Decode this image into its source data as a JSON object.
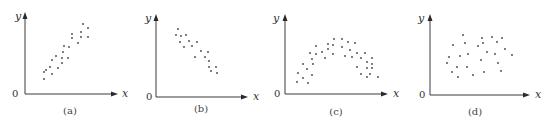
{
  "chart_data": [
    {
      "type": "scatter",
      "panel": "a",
      "caption": "(a)",
      "xlabel": "x",
      "ylabel": "y",
      "origin_label": "0",
      "description": "positive linear correlation",
      "axes": {
        "ox": 25,
        "oy": 94,
        "xend": 118,
        "ytop": 12,
        "ylabel_pos": [
          15,
          20
        ],
        "xlabel_pos": [
          122,
          97
        ],
        "zero_pos": [
          12,
          97
        ],
        "cap_pos": [
          70,
          114
        ]
      },
      "points": [
        [
          83,
          24
        ],
        [
          88,
          28
        ],
        [
          81,
          32
        ],
        [
          72,
          34
        ],
        [
          88,
          37
        ],
        [
          81,
          37
        ],
        [
          72,
          38
        ],
        [
          78,
          43
        ],
        [
          64,
          46
        ],
        [
          69,
          47
        ],
        [
          63,
          52
        ],
        [
          56,
          56
        ],
        [
          62,
          58
        ],
        [
          68,
          58
        ],
        [
          52,
          60
        ],
        [
          62,
          63
        ],
        [
          50,
          67
        ],
        [
          58,
          68
        ],
        [
          46,
          70
        ],
        [
          44,
          72
        ],
        [
          52,
          74
        ],
        [
          44,
          79
        ]
      ]
    },
    {
      "type": "scatter",
      "panel": "b",
      "caption": "(b)",
      "xlabel": "x",
      "ylabel": "y",
      "origin_label": "0",
      "description": "negative linear correlation",
      "axes": {
        "ox": 156,
        "oy": 97,
        "xend": 248,
        "ytop": 14,
        "ylabel_pos": [
          145,
          22
        ],
        "xlabel_pos": [
          253,
          100
        ],
        "zero_pos": [
          146,
          100
        ],
        "cap_pos": [
          201,
          112
        ]
      },
      "points": [
        [
          178,
          29
        ],
        [
          176,
          35
        ],
        [
          181,
          36
        ],
        [
          186,
          35
        ],
        [
          180,
          42
        ],
        [
          184,
          47
        ],
        [
          189,
          41
        ],
        [
          192,
          46
        ],
        [
          197,
          42
        ],
        [
          201,
          51
        ],
        [
          208,
          52
        ],
        [
          195,
          57
        ],
        [
          205,
          57
        ],
        [
          209,
          61
        ],
        [
          209,
          67
        ],
        [
          216,
          67
        ],
        [
          211,
          71
        ],
        [
          217,
          73
        ]
      ]
    },
    {
      "type": "scatter",
      "panel": "c",
      "caption": "(c)",
      "xlabel": "x",
      "ylabel": "y",
      "origin_label": "0",
      "description": "nonlinear (parabolic) relationship",
      "axes": {
        "ox": 285,
        "oy": 94,
        "xend": 388,
        "ytop": 14,
        "ylabel_pos": [
          273,
          22
        ],
        "xlabel_pos": [
          393,
          97
        ],
        "zero_pos": [
          274,
          97
        ],
        "cap_pos": [
          336,
          115
        ]
      },
      "points": [
        [
          334,
          39
        ],
        [
          342,
          39
        ],
        [
          348,
          42
        ],
        [
          355,
          43
        ],
        [
          328,
          44
        ],
        [
          333,
          45
        ],
        [
          316,
          46
        ],
        [
          342,
          47
        ],
        [
          328,
          49
        ],
        [
          322,
          52
        ],
        [
          350,
          50
        ],
        [
          310,
          53
        ],
        [
          316,
          54
        ],
        [
          333,
          54
        ],
        [
          345,
          56
        ],
        [
          357,
          53
        ],
        [
          365,
          53
        ],
        [
          325,
          58
        ],
        [
          312,
          59
        ],
        [
          352,
          57
        ],
        [
          361,
          58
        ],
        [
          372,
          58
        ],
        [
          303,
          64
        ],
        [
          313,
          64
        ],
        [
          367,
          62
        ],
        [
          372,
          64
        ],
        [
          307,
          69
        ],
        [
          357,
          67
        ],
        [
          367,
          68
        ],
        [
          372,
          68
        ],
        [
          298,
          73
        ],
        [
          312,
          75
        ],
        [
          361,
          74
        ],
        [
          370,
          74
        ],
        [
          303,
          78
        ],
        [
          367,
          77
        ],
        [
          297,
          82
        ],
        [
          378,
          77
        ],
        [
          308,
          83
        ]
      ]
    },
    {
      "type": "scatter",
      "panel": "d",
      "caption": "(d)",
      "xlabel": "x",
      "ylabel": "y",
      "origin_label": "0",
      "description": "no correlation",
      "axes": {
        "ox": 430,
        "oy": 95,
        "xend": 530,
        "ytop": 14,
        "ylabel_pos": [
          418,
          22
        ],
        "xlabel_pos": [
          535,
          98
        ],
        "zero_pos": [
          419,
          98
        ],
        "cap_pos": [
          475,
          115
        ]
      },
      "points": [
        [
          463,
          35
        ],
        [
          482,
          38
        ],
        [
          492,
          37
        ],
        [
          502,
          38
        ],
        [
          453,
          45
        ],
        [
          465,
          43
        ],
        [
          483,
          43
        ],
        [
          478,
          46
        ],
        [
          497,
          42
        ],
        [
          505,
          49
        ],
        [
          487,
          52
        ],
        [
          468,
          54
        ],
        [
          460,
          56
        ],
        [
          495,
          54
        ],
        [
          512,
          55
        ],
        [
          449,
          57
        ],
        [
          481,
          60
        ],
        [
          447,
          63
        ],
        [
          498,
          63
        ],
        [
          457,
          67
        ],
        [
          467,
          67
        ],
        [
          501,
          71
        ],
        [
          452,
          72
        ],
        [
          484,
          72
        ],
        [
          458,
          77
        ],
        [
          473,
          75
        ]
      ]
    }
  ]
}
